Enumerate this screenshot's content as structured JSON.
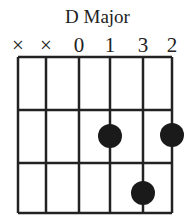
{
  "title": "D Major",
  "chord": {
    "name": "D Major",
    "strings": 6,
    "frets_shown": 3,
    "markers": [
      "×",
      "×",
      "0",
      "1",
      "3",
      "2"
    ],
    "fingering": [
      {
        "string": 4,
        "fret": 2
      },
      {
        "string": 6,
        "fret": 2
      },
      {
        "string": 5,
        "fret": 3
      }
    ]
  },
  "colors": {
    "line": "#222222",
    "dot": "#1a1a1a",
    "background": "#ffffff"
  }
}
